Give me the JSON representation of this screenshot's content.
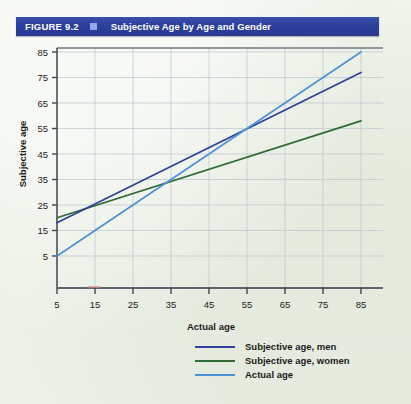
{
  "figure": {
    "number_label": "FIGURE 9.2",
    "title": "Subjective Age by Age and Gender",
    "header_bg": "#2c3f9c",
    "header_square_color": "#8fa9e8",
    "header_text_color": "#ffffff",
    "page_bg": "#eef2e9"
  },
  "legend": {
    "items": [
      {
        "label": "Subjective age, men",
        "color": "#2e3f9c"
      },
      {
        "label": "Subjective age, women",
        "color": "#2f6b35"
      },
      {
        "label": "Actual age",
        "color": "#4e92d6"
      }
    ]
  },
  "chart_data": {
    "type": "line",
    "title": "Subjective Age by Age and Gender",
    "xlabel": "Actual age",
    "ylabel": "Subjective age",
    "xlim": [
      0,
      90
    ],
    "ylim": [
      0,
      90
    ],
    "xticks": [
      5,
      15,
      25,
      35,
      45,
      55,
      65,
      75,
      85
    ],
    "yticks": [
      5,
      15,
      25,
      35,
      45,
      55,
      65,
      75,
      85
    ],
    "grid": true,
    "legend_position": "bottom-right",
    "x": [
      5,
      85
    ],
    "series": [
      {
        "name": "Subjective age, men",
        "color": "#2e3f9c",
        "values": [
          18,
          77
        ]
      },
      {
        "name": "Subjective age, women",
        "color": "#2f6b35",
        "values": [
          20,
          58
        ]
      },
      {
        "name": "Actual age",
        "color": "#4e92d6",
        "values": [
          5,
          85
        ]
      }
    ]
  }
}
